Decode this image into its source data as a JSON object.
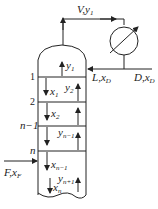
{
  "diagram": {
    "type": "distillation-column",
    "top_vapor": {
      "name": "V",
      "composition": "y",
      "sub": "1"
    },
    "reflux": {
      "name": "L",
      "composition": "x",
      "sub": "D"
    },
    "distillate": {
      "name": "D",
      "composition": "x",
      "sub": "D"
    },
    "feed": {
      "name": "F",
      "composition": "x",
      "sub": "F"
    },
    "plate_labels": [
      "1",
      "2",
      "n−1",
      "n"
    ],
    "streams": [
      {
        "name": "y",
        "sub": "1"
      },
      {
        "name": "x",
        "sub": "1"
      },
      {
        "name": "y",
        "sub": "2"
      },
      {
        "name": "x",
        "sub": "2"
      },
      {
        "name": "y",
        "sub": "n−1"
      },
      {
        "name": "x",
        "sub": "n−1"
      },
      {
        "name": "y",
        "sub": "n+1"
      },
      {
        "name": "x",
        "sub": "n"
      }
    ],
    "condenser": "condenser-icon"
  }
}
